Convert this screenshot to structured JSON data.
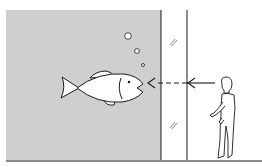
{
  "diagram": {
    "colors": {
      "water": "#cfcfcf",
      "line": "#1a1a1a",
      "background": "#ffffff",
      "fish_fill": "#ffffff"
    },
    "elements": [
      {
        "name": "aquarium-water",
        "type": "region"
      },
      {
        "name": "aquarium-glass-inner",
        "type": "line"
      },
      {
        "name": "glass-pane-outer",
        "type": "line"
      },
      {
        "name": "fish",
        "type": "figure"
      },
      {
        "name": "bubbles",
        "count": 3
      },
      {
        "name": "sight-line-arrow",
        "style": "solid then dashed",
        "direction": "from viewer toward fish"
      },
      {
        "name": "viewer",
        "type": "human-figure"
      },
      {
        "name": "glass-reflection-marks",
        "count": 2
      },
      {
        "name": "floor-line",
        "type": "line"
      }
    ]
  }
}
